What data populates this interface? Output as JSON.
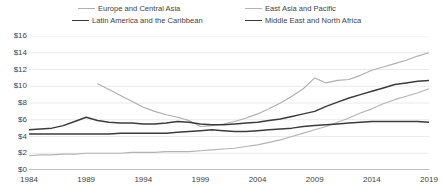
{
  "chart_data": {
    "type": "line",
    "title": "",
    "xlabel": "",
    "ylabel": "",
    "xlim": [
      1984,
      2019
    ],
    "ylim": [
      0,
      16
    ],
    "grid": true,
    "legend_position": "top",
    "y_tick_labels": [
      "$16",
      "$14",
      "$12",
      "$10",
      "$8",
      "$6",
      "$4",
      "$2",
      "$0"
    ],
    "y_ticks": [
      16,
      14,
      12,
      10,
      8,
      6,
      4,
      2,
      0
    ],
    "x_tick_labels": [
      "1984",
      "1989",
      "1994",
      "1999",
      "2004",
      "2009",
      "2014",
      "2019"
    ],
    "x_ticks": [
      1984,
      1989,
      1994,
      1999,
      2004,
      2009,
      2014,
      2019
    ],
    "x": [
      1984,
      1985,
      1986,
      1987,
      1988,
      1989,
      1990,
      1991,
      1992,
      1993,
      1994,
      1995,
      1996,
      1997,
      1998,
      1999,
      2000,
      2001,
      2002,
      2003,
      2004,
      2005,
      2006,
      2007,
      2008,
      2009,
      2010,
      2011,
      2012,
      2013,
      2014,
      2015,
      2016,
      2017,
      2018,
      2019
    ],
    "series": [
      {
        "name": "Europe and Central Asia",
        "color": "#aeaeae",
        "width": 1.1,
        "values": [
          null,
          null,
          null,
          null,
          null,
          null,
          10.3,
          9.6,
          8.9,
          8.2,
          7.5,
          7.0,
          6.6,
          6.3,
          5.9,
          5.2,
          5.3,
          5.5,
          5.8,
          6.2,
          6.7,
          7.3,
          8.0,
          8.8,
          9.7,
          11.0,
          10.4,
          10.7,
          10.8,
          11.3,
          11.9,
          12.3,
          12.7,
          13.1,
          13.6,
          14.0
        ]
      },
      {
        "name": "East Asia and Pacific",
        "color": "#b4b4b4",
        "width": 1.1,
        "values": [
          1.7,
          1.8,
          1.8,
          1.9,
          1.9,
          2.0,
          2.0,
          2.0,
          2.0,
          2.1,
          2.1,
          2.1,
          2.2,
          2.2,
          2.2,
          2.3,
          2.4,
          2.5,
          2.6,
          2.8,
          3.0,
          3.3,
          3.6,
          4.0,
          4.4,
          4.8,
          5.2,
          5.7,
          6.2,
          6.8,
          7.3,
          7.9,
          8.4,
          8.8,
          9.2,
          9.7
        ]
      },
      {
        "name": "Latin America and the Caribbean",
        "color": "#3c3c3c",
        "width": 1.5,
        "values": [
          4.3,
          4.3,
          4.3,
          4.3,
          4.3,
          4.3,
          4.3,
          4.3,
          4.4,
          4.4,
          4.4,
          4.4,
          4.4,
          4.5,
          4.6,
          4.7,
          4.8,
          4.7,
          4.6,
          4.6,
          4.7,
          4.8,
          4.9,
          5.0,
          5.2,
          5.3,
          5.4,
          5.5,
          5.6,
          5.7,
          5.8,
          5.8,
          5.8,
          5.8,
          5.8,
          5.7
        ]
      },
      {
        "name": "Middle East and North Africa",
        "color": "#3c3c3c",
        "width": 1.5,
        "values": [
          4.8,
          4.9,
          5.0,
          5.3,
          5.8,
          6.3,
          5.9,
          5.7,
          5.6,
          5.6,
          5.5,
          5.5,
          5.6,
          5.8,
          5.7,
          5.5,
          5.4,
          5.4,
          5.5,
          5.6,
          5.7,
          5.9,
          6.1,
          6.4,
          6.7,
          7.0,
          7.6,
          8.1,
          8.6,
          9.0,
          9.4,
          9.8,
          10.2,
          10.4,
          10.6,
          10.7
        ]
      }
    ]
  },
  "legend": {
    "items": [
      {
        "label": "Europe and Central Asia"
      },
      {
        "label": "East Asia and Pacific"
      },
      {
        "label": "Latin America and the Caribbean"
      },
      {
        "label": "Middle East and North Africa"
      }
    ]
  }
}
